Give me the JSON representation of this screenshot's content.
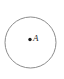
{
  "figure": {
    "kind": "geometry-diagram",
    "background_color": "#ffffff",
    "width": 64,
    "height": 79
  },
  "circle": {
    "name": "circle-outline",
    "center_x": 30.5,
    "center_y": 42.5,
    "radius": 25.5,
    "stroke_color": "#8c8c8c",
    "stroke_width": 1,
    "fill": "none"
  },
  "points": [
    {
      "id": "A",
      "label": "A",
      "dot_x": 30,
      "dot_y": 39.5,
      "dot_radius": 1.7,
      "dot_color": "#1a1a1a",
      "label_color": "#2b2b2b"
    }
  ]
}
